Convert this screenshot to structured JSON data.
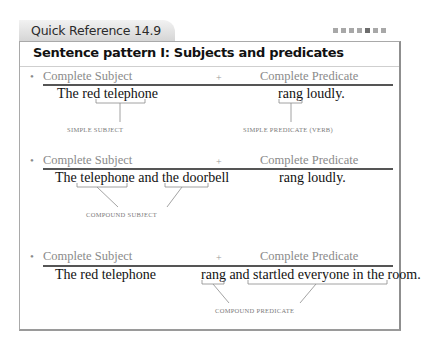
{
  "header": {
    "tab_title": "Quick Reference 14.9",
    "dots": [
      {
        "shade": "light"
      },
      {
        "shade": "light"
      },
      {
        "shade": "light"
      },
      {
        "shade": "light"
      },
      {
        "shade": "dark"
      },
      {
        "shade": "light"
      },
      {
        "shade": "light"
      }
    ]
  },
  "box": {
    "heading": "Sentence pattern I: Subjects and predicates"
  },
  "examples": [
    {
      "subject_label": "Complete Subject",
      "plus": "+",
      "predicate_label": "Complete Predicate",
      "subject_text": "The red telephone",
      "predicate_text": "rang loudly.",
      "caption_left": "SIMPLE SUBJECT",
      "caption_right": "SIMPLE PREDICATE (VERB)"
    },
    {
      "subject_label": "Complete Subject",
      "plus": "+",
      "predicate_label": "Complete Predicate",
      "subject_text": "The telephone and the doorbell",
      "predicate_text": "rang loudly.",
      "caption": "COMPOUND SUBJECT"
    },
    {
      "subject_label": "Complete Subject",
      "plus": "+",
      "predicate_label": "Complete Predicate",
      "subject_text": "The red telephone",
      "predicate_text": "rang and startled everyone in the room.",
      "caption": "COMPOUND PREDICATE"
    }
  ],
  "bullet": "•"
}
